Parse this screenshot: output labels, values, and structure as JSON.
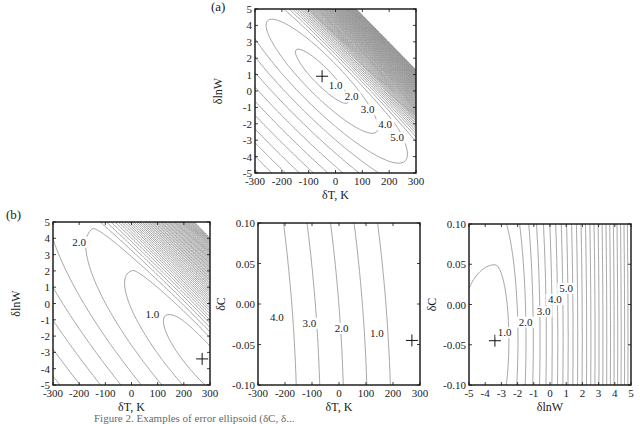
{
  "figure": {
    "panel_a_label": "(a)",
    "panel_b_label": "(b)",
    "caption_partial": "Figure 2. Examples of error ellipsoid (δC, δ..."
  },
  "chart_data": [
    {
      "id": "a",
      "type": "contour",
      "title": "(a)",
      "xlabel": "δT, K",
      "ylabel": "δlnW",
      "xlim": [
        -300,
        300
      ],
      "ylim": [
        -5,
        5
      ],
      "xticks": [
        "-300",
        "-200",
        "-100",
        "0",
        "100",
        "200",
        "300"
      ],
      "yticks": [
        "5",
        "4",
        "3",
        "2",
        "1",
        "0",
        "-1",
        "-2",
        "-3",
        "-4",
        "-5"
      ],
      "minimum_marker": {
        "x": -50,
        "y": 0.9
      },
      "contour_labels": [
        {
          "text": "1.0",
          "x": 0,
          "y": 0.2
        },
        {
          "text": "2.0",
          "x": 60,
          "y": -0.5
        },
        {
          "text": "3.0",
          "x": 120,
          "y": -1.3
        },
        {
          "text": "4.0",
          "x": 185,
          "y": -2.2
        },
        {
          "text": "5.0",
          "x": 230,
          "y": -3.0
        }
      ],
      "notes": "Elongated elliptical contours along anti-diagonal; dense contours in upper-right corner"
    },
    {
      "id": "b1",
      "type": "contour",
      "title": "(b)",
      "xlabel": "δT, K",
      "ylabel": "δlnW",
      "xlim": [
        -300,
        300
      ],
      "ylim": [
        -5,
        5
      ],
      "xticks": [
        "-300",
        "-200",
        "-100",
        "0",
        "100",
        "200",
        "300"
      ],
      "yticks": [
        "5",
        "4",
        "3",
        "2",
        "1",
        "0",
        "-1",
        "-2",
        "-3",
        "-4",
        "-5"
      ],
      "minimum_marker": {
        "x": 270,
        "y": -3.4
      },
      "contour_labels": [
        {
          "text": "2.0",
          "x": -200,
          "y": 3.6
        },
        {
          "text": "1.0",
          "x": 80,
          "y": -0.8
        }
      ]
    },
    {
      "id": "b2",
      "type": "contour",
      "title": "",
      "xlabel": "δT, K",
      "ylabel": "δC",
      "xlim": [
        -300,
        300
      ],
      "ylim": [
        -0.1,
        0.1
      ],
      "xticks": [
        "-300",
        "-200",
        "-100",
        "0",
        "100",
        "200",
        "300"
      ],
      "yticks": [
        "0.10",
        "0.05",
        "0.00",
        "-0.05",
        "-0.10"
      ],
      "minimum_marker": {
        "x": 270,
        "y": -0.045
      },
      "contour_labels": [
        {
          "text": "4.0",
          "x": -230,
          "y": -0.02
        },
        {
          "text": "3.0",
          "x": -110,
          "y": -0.027
        },
        {
          "text": "2.0",
          "x": 10,
          "y": -0.033
        },
        {
          "text": "1.0",
          "x": 140,
          "y": -0.04
        }
      ]
    },
    {
      "id": "b3",
      "type": "contour",
      "title": "",
      "xlabel": "δlnW",
      "ylabel": "δC",
      "xlim": [
        -5,
        5
      ],
      "ylim": [
        -0.1,
        0.1
      ],
      "xticks": [
        "-5",
        "-4",
        "-3",
        "-2",
        "-1",
        "0",
        "1",
        "2",
        "3",
        "4",
        "5"
      ],
      "yticks": [
        "0.10",
        "0.05",
        "0.00",
        "-0.05",
        "-0.10"
      ],
      "minimum_marker": {
        "x": -3.4,
        "y": -0.045
      },
      "contour_labels": [
        {
          "text": "1.0",
          "x": -2.8,
          "y": -0.038
        },
        {
          "text": "2.0",
          "x": -1.5,
          "y": -0.025
        },
        {
          "text": "3.0",
          "x": -0.4,
          "y": -0.012
        },
        {
          "text": "4.0",
          "x": 0.3,
          "y": 0.003
        },
        {
          "text": "5.0",
          "x": 1.0,
          "y": 0.017
        }
      ]
    }
  ]
}
